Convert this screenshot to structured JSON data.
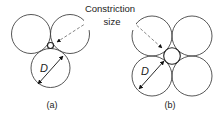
{
  "callout": {
    "line1": "Constriction",
    "line2": "size"
  },
  "dimension_label": "D",
  "panels": [
    {
      "label": "(a)",
      "arrangement": "three spheres, triangular packing"
    },
    {
      "label": "(b)",
      "arrangement": "four spheres, square packing"
    }
  ],
  "colors": {
    "stroke": "#333333",
    "dashed": "#666666",
    "text": "#222222"
  }
}
